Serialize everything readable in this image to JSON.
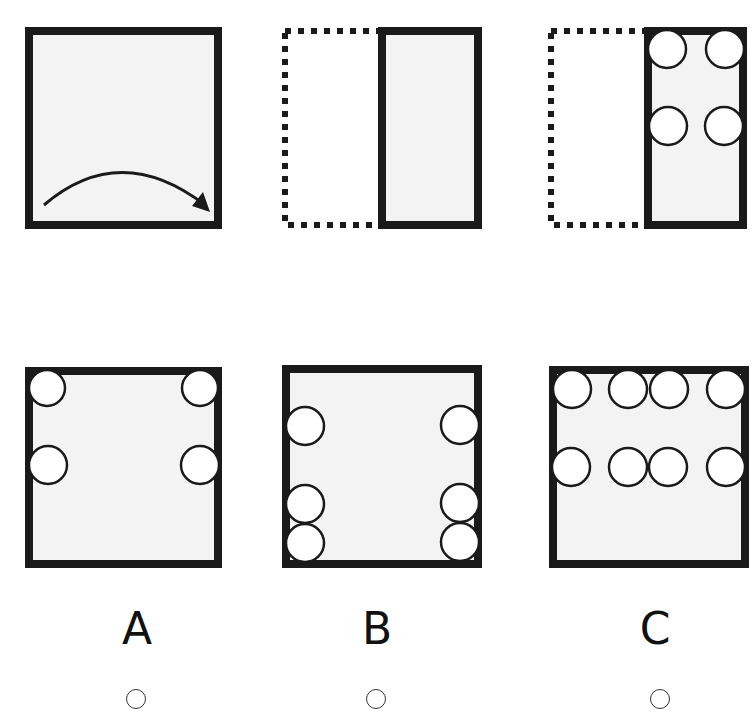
{
  "puzzle": {
    "instruction_panels": [
      {
        "name": "square-with-fold-arrow",
        "description": "square with curved arrow indicating fold from left to right"
      },
      {
        "name": "folded-rectangle",
        "description": "left half dotted (folded over), right half solid"
      },
      {
        "name": "folded-with-holes",
        "description": "folded rectangle with 4 holes punched"
      }
    ],
    "options": [
      {
        "label": "A",
        "holes": 4
      },
      {
        "label": "B",
        "holes": 6
      },
      {
        "label": "C",
        "holes": 8
      }
    ]
  },
  "colors": {
    "stroke": "#1a1a1a",
    "fill": "#f3f3f3",
    "hole": "#ffffff"
  }
}
